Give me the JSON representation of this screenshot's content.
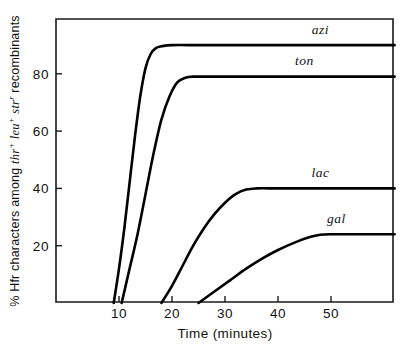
{
  "chart_data": {
    "type": "line",
    "title": "",
    "xlabel": "Time (minutes)",
    "ylabel": "% Hfr characters among thr+ leu+ str-r recombinants",
    "ylabel_parts": {
      "lead": "% Hfr characters among ",
      "gene1": "thr",
      "sup1": "+",
      "mid1": " ",
      "gene2": "leu",
      "sup2": "+",
      "mid2": " ",
      "gene3": "str",
      "sup3": "r",
      "tail": " recombinants"
    },
    "xlim": [
      0,
      62
    ],
    "ylim": [
      0,
      100
    ],
    "xticks": [
      10,
      20,
      30,
      40,
      50
    ],
    "xticklabels": [
      "10",
      "20",
      "30",
      "40",
      "50"
    ],
    "yticks": [
      20,
      40,
      60,
      80
    ],
    "yticklabels": [
      "20",
      "40",
      "60",
      "80"
    ],
    "grid": false,
    "legend_position": "inline-curve-labels",
    "series": [
      {
        "name": "azi",
        "label": "azi",
        "color": "#000000",
        "onset_minutes": 9,
        "plateau_percent": 90,
        "label_x": 48,
        "label_y": 94,
        "points": [
          [
            9,
            0
          ],
          [
            10,
            12
          ],
          [
            11,
            26
          ],
          [
            12,
            42
          ],
          [
            13,
            58
          ],
          [
            14,
            72
          ],
          [
            15,
            82
          ],
          [
            16,
            87
          ],
          [
            17,
            89
          ],
          [
            18,
            89.6
          ],
          [
            20,
            90
          ],
          [
            25,
            90
          ],
          [
            30,
            90
          ],
          [
            40,
            90
          ],
          [
            50,
            90
          ],
          [
            62,
            90
          ]
        ]
      },
      {
        "name": "ton",
        "label": "ton",
        "color": "#000000",
        "onset_minutes": 10.5,
        "plateau_percent": 79,
        "label_x": 45,
        "label_y": 83,
        "points": [
          [
            10.5,
            0
          ],
          [
            12,
            12
          ],
          [
            13.5,
            24
          ],
          [
            15,
            38
          ],
          [
            16.5,
            52
          ],
          [
            18,
            64
          ],
          [
            19.5,
            72
          ],
          [
            21,
            77
          ],
          [
            22.5,
            78.6
          ],
          [
            24,
            79
          ],
          [
            28,
            79
          ],
          [
            34,
            79
          ],
          [
            42,
            79
          ],
          [
            50,
            79
          ],
          [
            62,
            79
          ]
        ]
      },
      {
        "name": "lac",
        "label": "lac",
        "color": "#000000",
        "onset_minutes": 18,
        "plateau_percent": 40,
        "label_x": 48,
        "label_y": 44,
        "points": [
          [
            18,
            0
          ],
          [
            20,
            6
          ],
          [
            22,
            13
          ],
          [
            24,
            20
          ],
          [
            26,
            26
          ],
          [
            28,
            31
          ],
          [
            30,
            35
          ],
          [
            32,
            38
          ],
          [
            34,
            39.6
          ],
          [
            36,
            40
          ],
          [
            40,
            40
          ],
          [
            46,
            40
          ],
          [
            52,
            40
          ],
          [
            62,
            40
          ]
        ]
      },
      {
        "name": "gal",
        "label": "gal",
        "color": "#000000",
        "onset_minutes": 25,
        "plateau_percent": 24,
        "label_x": 51,
        "label_y": 28,
        "points": [
          [
            25,
            0
          ],
          [
            28,
            4
          ],
          [
            31,
            8
          ],
          [
            34,
            12
          ],
          [
            37,
            15.5
          ],
          [
            40,
            18.5
          ],
          [
            43,
            21
          ],
          [
            46,
            23
          ],
          [
            48,
            23.8
          ],
          [
            50,
            24
          ],
          [
            54,
            24
          ],
          [
            58,
            24
          ],
          [
            62,
            24
          ]
        ]
      }
    ]
  },
  "axes": {
    "x_title": "Time (minutes)"
  }
}
